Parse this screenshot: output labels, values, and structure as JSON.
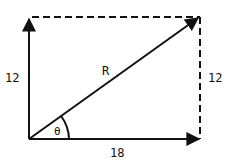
{
  "diagram": {
    "type": "vector-addition",
    "labels": {
      "left_side": "12",
      "right_side": "12",
      "bottom_side": "18",
      "resultant": "R",
      "angle": "θ"
    },
    "colors": {
      "line": "#111111",
      "background": "#ffffff"
    }
  }
}
